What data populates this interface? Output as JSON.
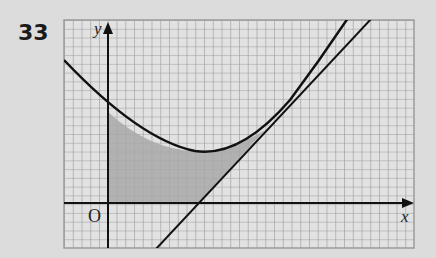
{
  "problem": {
    "number": "33"
  },
  "figure": {
    "x_axis_label": "x",
    "y_axis_label": "y",
    "origin_label": "O",
    "curves": [
      "parabola",
      "tangent line"
    ],
    "shaded_region": "between parabola, tangent line, y-axis and x-axis",
    "colors": {
      "grid": "#9a9a9a",
      "curve": "#111111",
      "shade": "#a8a8a8",
      "paper": "#dcdcdc"
    }
  }
}
